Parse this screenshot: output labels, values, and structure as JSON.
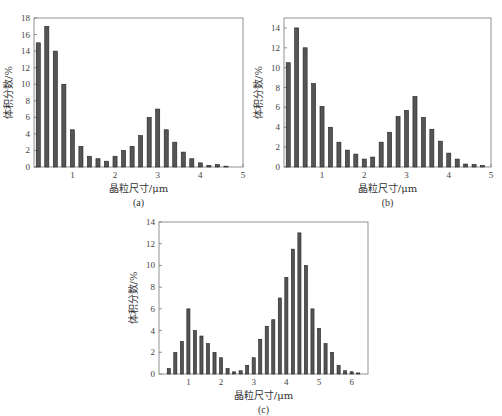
{
  "figure": {
    "panels": [
      "a",
      "b",
      "c"
    ]
  },
  "chart_data": [
    {
      "id": "a",
      "type": "bar",
      "caption": "(a)",
      "xlabel": "晶粒尺寸/μm",
      "ylabel": "体积分数/%",
      "xlim": [
        0.1,
        5
      ],
      "ylim": [
        0,
        18
      ],
      "xticks": [
        1,
        2,
        3,
        4,
        5
      ],
      "yticks": [
        0,
        2,
        4,
        6,
        8,
        10,
        12,
        14,
        16,
        18
      ],
      "grid": false,
      "bar_color": "#555555",
      "x": [
        0.2,
        0.4,
        0.6,
        0.8,
        1.0,
        1.2,
        1.4,
        1.6,
        1.8,
        2.0,
        2.2,
        2.4,
        2.6,
        2.8,
        3.0,
        3.2,
        3.4,
        3.6,
        3.8,
        4.0,
        4.2,
        4.4,
        4.6
      ],
      "values": [
        15,
        17,
        14,
        10,
        4.5,
        2.5,
        1.3,
        1.0,
        0.7,
        1.3,
        2.0,
        2.5,
        3.8,
        6.0,
        7.0,
        4.5,
        3.0,
        1.8,
        1.0,
        0.5,
        0.2,
        0.3,
        0.1
      ],
      "frame": {
        "left": 34,
        "top": 18,
        "width": 209,
        "height": 149
      }
    },
    {
      "id": "b",
      "type": "bar",
      "caption": "(b)",
      "xlabel": "晶粒尺寸/μm",
      "ylabel": "体积分数/%",
      "xlim": [
        0.1,
        5
      ],
      "ylim": [
        0,
        15
      ],
      "xticks": [
        1,
        2,
        3,
        4,
        5
      ],
      "yticks": [
        0,
        2,
        4,
        6,
        8,
        10,
        12,
        14
      ],
      "grid": false,
      "bar_color": "#555555",
      "x": [
        0.2,
        0.4,
        0.6,
        0.8,
        1.0,
        1.2,
        1.4,
        1.6,
        1.8,
        2.0,
        2.2,
        2.4,
        2.6,
        2.8,
        3.0,
        3.2,
        3.4,
        3.6,
        3.8,
        4.0,
        4.2,
        4.4,
        4.6,
        4.8
      ],
      "values": [
        10.5,
        14,
        12,
        8.4,
        6.1,
        4.0,
        2.5,
        1.7,
        1.3,
        0.8,
        1.0,
        2.5,
        3.5,
        5.1,
        5.7,
        7.1,
        5.0,
        3.8,
        2.6,
        1.4,
        0.8,
        0.3,
        0.25,
        0.15
      ],
      "frame": {
        "left": 284,
        "top": 18,
        "width": 207,
        "height": 149
      }
    },
    {
      "id": "c",
      "type": "bar",
      "caption": "(c)",
      "xlabel": "晶粒尺寸/μm",
      "ylabel": "体积分数/%",
      "xlim": [
        0.1,
        6.5
      ],
      "ylim": [
        0,
        14
      ],
      "xticks": [
        1,
        2,
        3,
        4,
        5,
        6
      ],
      "yticks": [
        0,
        2,
        4,
        6,
        8,
        10,
        12,
        14
      ],
      "grid": false,
      "bar_color": "#555555",
      "x": [
        0.4,
        0.6,
        0.8,
        1.0,
        1.2,
        1.4,
        1.6,
        1.8,
        2.0,
        2.2,
        2.4,
        2.6,
        2.8,
        3.0,
        3.2,
        3.4,
        3.6,
        3.8,
        4.0,
        4.2,
        4.4,
        4.6,
        4.8,
        5.0,
        5.2,
        5.4,
        5.6,
        5.8,
        6.0,
        6.2
      ],
      "values": [
        0.5,
        2.0,
        3.0,
        6.0,
        4.0,
        3.5,
        2.8,
        2.0,
        1.5,
        0.5,
        0.2,
        0.3,
        0.8,
        1.5,
        3.2,
        4.4,
        5.0,
        7.0,
        8.9,
        11.5,
        13.0,
        10.0,
        6.0,
        4.2,
        2.8,
        2.0,
        0.8,
        0.3,
        0.2,
        0.1
      ],
      "frame": {
        "left": 159,
        "top": 222,
        "width": 209,
        "height": 152
      }
    }
  ]
}
